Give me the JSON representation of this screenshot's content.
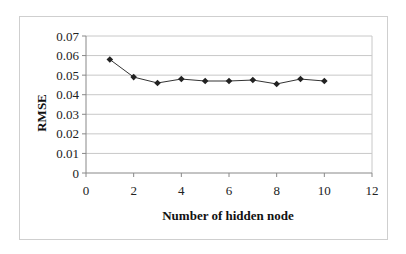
{
  "chart_data": {
    "type": "line",
    "title": "",
    "xlabel": "Number of hidden node",
    "ylabel": "RMSE",
    "x": [
      1,
      2,
      3,
      4,
      5,
      6,
      7,
      8,
      9,
      10
    ],
    "series": [
      {
        "name": "RMSE",
        "values": [
          0.058,
          0.049,
          0.046,
          0.048,
          0.047,
          0.047,
          0.0475,
          0.0455,
          0.048,
          0.047
        ],
        "marker": "diamond",
        "color": "#333333"
      }
    ],
    "xlim": [
      0,
      12
    ],
    "ylim": [
      0,
      0.07
    ],
    "x_ticks": [
      "0",
      "2",
      "4",
      "6",
      "8",
      "10",
      "12"
    ],
    "y_ticks": [
      "0",
      "0.01",
      "0.02",
      "0.03",
      "0.04",
      "0.05",
      "0.06",
      "0.07"
    ],
    "grid": {
      "horizontal": true,
      "vertical": false,
      "color": "#c8c8c8"
    },
    "legend": null
  }
}
